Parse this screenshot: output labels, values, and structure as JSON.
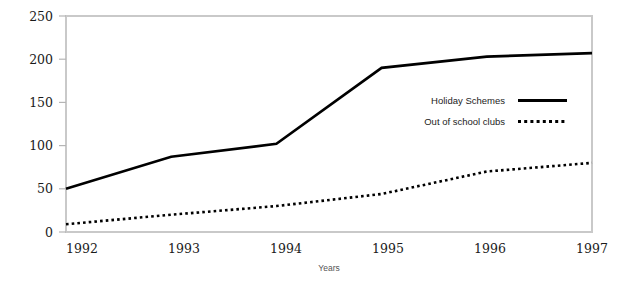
{
  "chart_data": {
    "type": "line",
    "title": "",
    "xlabel": "Years",
    "ylabel": "",
    "categories": [
      "1992",
      "1993",
      "1994",
      "1995",
      "1996",
      "1997"
    ],
    "x": [
      1992,
      1993,
      1994,
      1995,
      1996,
      1997
    ],
    "xlim": [
      1992,
      1997
    ],
    "ylim": [
      0,
      250
    ],
    "yticks": [
      0,
      50,
      100,
      150,
      200,
      250
    ],
    "xticks": [
      1992,
      1993,
      1994,
      1995,
      1996,
      1997
    ],
    "grid": false,
    "legend_position": "center-right",
    "series": [
      {
        "name": "Holiday Schemes",
        "style": "solid",
        "color": "#000000",
        "values": [
          50,
          87,
          102,
          190,
          203,
          207
        ]
      },
      {
        "name": "Out of school clubs",
        "style": "dotted",
        "color": "#000000",
        "values": [
          9,
          20,
          30,
          44,
          70,
          80
        ]
      }
    ]
  },
  "axes": {
    "y_tick_labels": [
      "0",
      "50",
      "100",
      "150",
      "200",
      "250"
    ],
    "x_tick_labels": [
      "1992",
      "1993",
      "1994",
      "1995",
      "1996",
      "1997"
    ],
    "x_axis_title": "Years"
  },
  "legend": {
    "entries": [
      {
        "label": "Holiday Schemes",
        "style": "solid"
      },
      {
        "label": "Out of school clubs",
        "style": "dotted"
      }
    ]
  },
  "colors": {
    "background": "#ffffff",
    "frame": "#c9c9c9",
    "series": "#000000",
    "tick_text": "#1a1a1a",
    "axis_title_text": "#555555"
  }
}
